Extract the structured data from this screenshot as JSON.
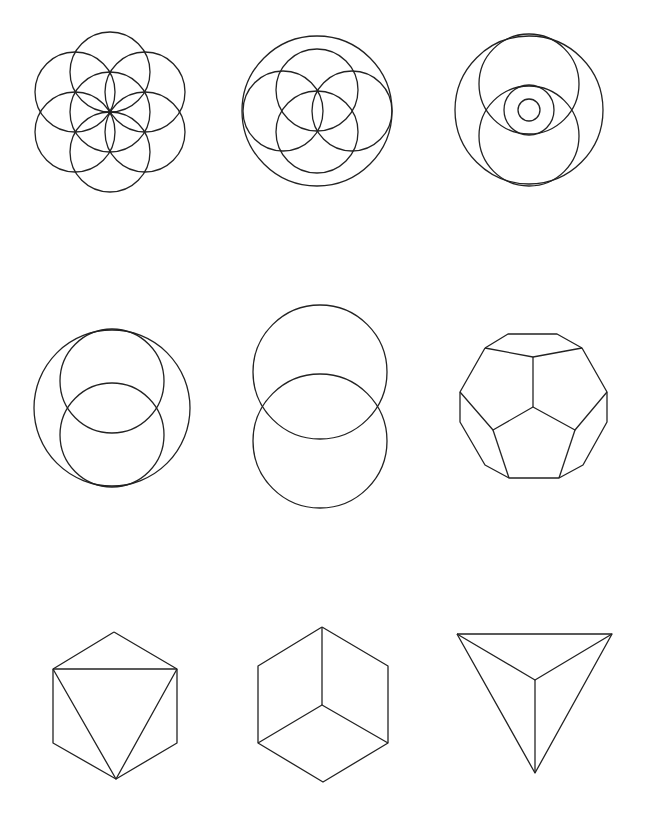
{
  "canvas": {
    "width": 648,
    "height": 819,
    "background": "#ffffff",
    "stroke": "#222222"
  },
  "figures": [
    {
      "id": "seed-of-life",
      "circles": [
        [
          110,
          112,
          40
        ],
        [
          110,
          72,
          40
        ],
        [
          145,
          92,
          40
        ],
        [
          145,
          132,
          40
        ],
        [
          110,
          152,
          40
        ],
        [
          75,
          132,
          40
        ],
        [
          75,
          92,
          40
        ]
      ]
    },
    {
      "id": "enclosed-four-circles",
      "circles": [
        [
          317,
          111,
          75
        ],
        [
          317,
          90,
          41
        ],
        [
          317,
          132,
          41
        ],
        [
          283,
          111,
          40
        ],
        [
          352,
          111,
          40
        ]
      ]
    },
    {
      "id": "eye-vesica",
      "circles": [
        [
          529,
          110,
          74
        ],
        [
          529,
          84,
          50
        ],
        [
          529,
          136,
          50
        ],
        [
          529,
          110,
          25
        ],
        [
          529,
          110,
          11
        ]
      ]
    },
    {
      "id": "vesica-in-circle",
      "circles": [
        [
          112,
          408,
          78
        ],
        [
          112,
          381,
          52
        ],
        [
          112,
          435,
          52
        ]
      ]
    },
    {
      "id": "vesica-piscis",
      "circles": [
        [
          320,
          372,
          67
        ],
        [
          320,
          441,
          67
        ]
      ]
    },
    {
      "id": "dodecahedron",
      "polylines": [
        [
          [
            485,
            348
          ],
          [
            508,
            334
          ],
          [
            557,
            334
          ],
          [
            582,
            348
          ],
          [
            607,
            392
          ],
          [
            607,
            422
          ],
          [
            583,
            465
          ],
          [
            559,
            478
          ],
          [
            509,
            478
          ],
          [
            485,
            465
          ],
          [
            460,
            422
          ],
          [
            460,
            392
          ],
          [
            485,
            348
          ]
        ],
        [
          [
            485,
            348
          ],
          [
            533,
            357
          ],
          [
            582,
            348
          ]
        ],
        [
          [
            533,
            357
          ],
          [
            533,
            407
          ]
        ],
        [
          [
            460,
            392
          ],
          [
            493,
            430
          ],
          [
            533,
            407
          ],
          [
            575,
            430
          ],
          [
            607,
            392
          ]
        ],
        [
          [
            493,
            430
          ],
          [
            509,
            478
          ]
        ],
        [
          [
            575,
            430
          ],
          [
            559,
            478
          ]
        ]
      ]
    },
    {
      "id": "octahedron",
      "polylines": [
        [
          [
            114,
            632
          ],
          [
            177,
            669
          ],
          [
            177,
            743
          ],
          [
            116,
            779
          ],
          [
            53,
            743
          ],
          [
            53,
            669
          ],
          [
            114,
            632
          ]
        ],
        [
          [
            53,
            669
          ],
          [
            177,
            669
          ]
        ],
        [
          [
            53,
            669
          ],
          [
            116,
            779
          ],
          [
            177,
            669
          ]
        ]
      ]
    },
    {
      "id": "cube",
      "polylines": [
        [
          [
            322,
            627
          ],
          [
            388,
            666
          ],
          [
            388,
            743
          ],
          [
            323,
            782
          ],
          [
            258,
            743
          ],
          [
            258,
            666
          ],
          [
            322,
            627
          ]
        ],
        [
          [
            322,
            627
          ],
          [
            322,
            705
          ]
        ],
        [
          [
            258,
            743
          ],
          [
            322,
            705
          ],
          [
            388,
            743
          ]
        ]
      ]
    },
    {
      "id": "tetrahedron",
      "polylines": [
        [
          [
            457,
            634
          ],
          [
            612,
            634
          ],
          [
            535,
            773
          ],
          [
            457,
            634
          ]
        ],
        [
          [
            457,
            634
          ],
          [
            535,
            680
          ],
          [
            612,
            634
          ]
        ],
        [
          [
            535,
            680
          ],
          [
            535,
            773
          ]
        ]
      ]
    }
  ]
}
